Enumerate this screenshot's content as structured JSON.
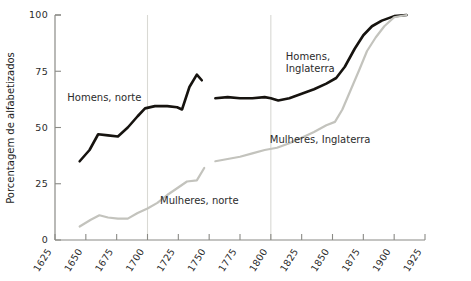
{
  "chart_data": {
    "type": "line",
    "title": "",
    "subtitle": "",
    "xlabel": "",
    "ylabel": "Porcentagem de alfabetizados",
    "xlim": [
      1625,
      1925
    ],
    "ylim": [
      0,
      100
    ],
    "grid": "vertical-only",
    "gridlines_x": [
      1700,
      1800
    ],
    "legend_position": "inline-annotations",
    "xticks": [
      1625,
      1650,
      1675,
      1700,
      1725,
      1750,
      1775,
      1800,
      1825,
      1850,
      1875,
      1900,
      1925
    ],
    "xtick_labels": [
      "1625",
      "1650",
      "1675",
      "1700",
      "1725",
      "1750",
      "1775",
      "1800",
      "1825",
      "1850",
      "1875",
      "1900",
      "1925"
    ],
    "yticks": [
      0,
      25,
      50,
      75,
      100
    ],
    "ytick_labels": [
      "0",
      "25",
      "50",
      "75",
      "100"
    ],
    "series": [
      {
        "name": "Homens, norte",
        "color": "#16130f",
        "label": "Homens, norte",
        "label_x": 1665,
        "label_y": 62,
        "x": [
          1645,
          1653,
          1660,
          1668,
          1676,
          1684,
          1692,
          1698,
          1706,
          1716,
          1724,
          1728,
          1734,
          1740,
          1744
        ],
        "values": [
          35,
          40,
          47,
          46.5,
          46,
          50,
          55,
          58.5,
          59.5,
          59.5,
          59,
          58,
          68,
          73.5,
          71
        ]
      },
      {
        "name": "Mulheres, norte",
        "color": "#c3c3bd",
        "label": "Mulheres, norte",
        "label_x": 1742,
        "label_y": 16,
        "x": [
          1645,
          1654,
          1661,
          1668,
          1676,
          1684,
          1692,
          1700,
          1708,
          1716,
          1724,
          1732,
          1740,
          1746
        ],
        "values": [
          6,
          9,
          11,
          10,
          9.5,
          9.5,
          12,
          14,
          16.5,
          20,
          23,
          26,
          26.5,
          32
        ]
      },
      {
        "name": "Homens, Inglaterra",
        "color": "#16130f",
        "label": "Homens, Inglaterra",
        "label_lines": [
          "Homens,",
          "Inglaterra"
        ],
        "label_x": 1830,
        "label_y": 80,
        "x": [
          1755,
          1765,
          1775,
          1785,
          1795,
          1800,
          1806,
          1815,
          1825,
          1835,
          1845,
          1853,
          1860,
          1868,
          1875,
          1882,
          1890,
          1900,
          1910
        ],
        "values": [
          63,
          63.5,
          63,
          63,
          63.5,
          63,
          62,
          63,
          65,
          67,
          69.5,
          72,
          77,
          85,
          91,
          95,
          97.5,
          99.5,
          100
        ]
      },
      {
        "name": "Mulheres, Inglaterra",
        "color": "#c3c3bd",
        "label": "Mulheres, Inglaterra",
        "label_x": 1840,
        "label_y": 43,
        "x": [
          1755,
          1765,
          1775,
          1785,
          1795,
          1805,
          1815,
          1825,
          1835,
          1845,
          1852,
          1858,
          1865,
          1872,
          1878,
          1885,
          1892,
          1900,
          1910
        ],
        "values": [
          35,
          36,
          37,
          38.5,
          40,
          41,
          43,
          45.5,
          48,
          51,
          52.5,
          58,
          67,
          76,
          84,
          90,
          95,
          99,
          100
        ]
      }
    ]
  }
}
